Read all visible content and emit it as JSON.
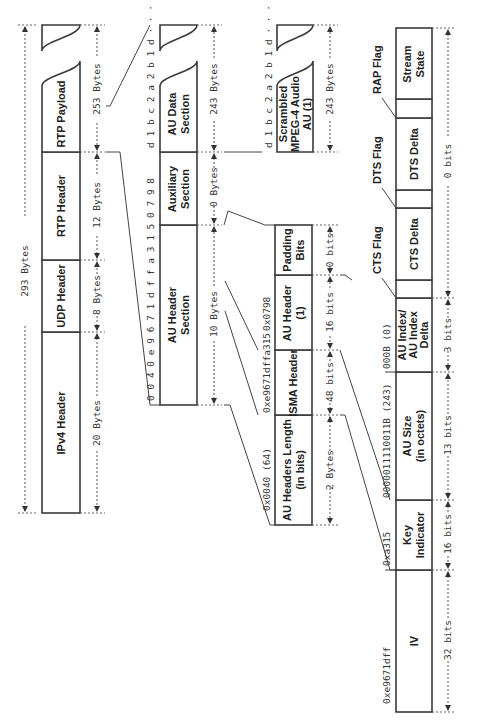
{
  "diagram": {
    "orientation": "rotated-90-ccw",
    "total": {
      "label": "293 Bytes"
    },
    "packet": {
      "fields": [
        {
          "name": "IPv4 Header",
          "size": "20 Bytes"
        },
        {
          "name": "UDP Header",
          "size": "8 Bytes"
        },
        {
          "name": "RTP Header",
          "size": "12 Bytes"
        },
        {
          "name": "RTP Payload",
          "size": "253 Bytes"
        }
      ]
    },
    "payload": {
      "fields": [
        {
          "name": "AU Header Section",
          "size": "10 Bytes",
          "hex": "0 0 4 0 e 9 6 7 1 d f f a 3 1 5 0 7 9 8"
        },
        {
          "name": "Auxiliary Section",
          "size": "0 Bytes"
        },
        {
          "name": "AU Data Section",
          "size": "243 Bytes",
          "hex": "d 1 b c 2 a 2 b 1 d · · · 1 2"
        }
      ]
    },
    "au_header_section": {
      "fields": [
        {
          "name": "AU Headers Length (in bits)",
          "line1": "AU Headers Length",
          "line2": "(in bits)",
          "size": "2 Bytes",
          "value": "0x0040  (64)"
        },
        {
          "name": "ISMA Header",
          "size": "48 bits",
          "value": "0xe9671dffa315"
        },
        {
          "name": "AU Header (1)",
          "line1": "AU Header",
          "line2": "(1)",
          "size": "16 bits",
          "value": "0x0798"
        },
        {
          "name": "Padding Bits",
          "line1": "Padding",
          "line2": "Bits",
          "size": "0 bits"
        }
      ]
    },
    "au_data": {
      "name": "Scrambled MPEG-4 Audio AU (1)",
      "line1": "Scrambled",
      "line2": "MPEG-4 Audio",
      "line3": "AU (1)",
      "size": "243 Bytes",
      "hex": "d 1 b c 2 a 2 b 1 d · · · 1 2"
    },
    "detail": {
      "fields": [
        {
          "name": "IV",
          "size": "32 bits",
          "value": "0xe9671dff"
        },
        {
          "name": "Key Indicator",
          "line1": "Key",
          "line2": "Indicator",
          "size": "16 bits",
          "value": "0xa315"
        },
        {
          "name": "AU Size (in octets)",
          "line1": "AU Size",
          "line2": "(in octets)",
          "size": "13 bits",
          "value": "0000011110011B  (243)"
        },
        {
          "name": "AU Index / AU Index Delta",
          "line1": "AU Index/",
          "line2": "AU Index",
          "line3": "Delta",
          "size": "3 bits",
          "value": "000B  (0)"
        },
        {
          "name": "CTS Delta"
        },
        {
          "name": "DTS Delta"
        },
        {
          "name": "Stream State"
        }
      ],
      "flags": [
        "CTS Flag",
        "DTS Flag",
        "RAP Flag"
      ],
      "tail_size": "0 bits"
    }
  }
}
